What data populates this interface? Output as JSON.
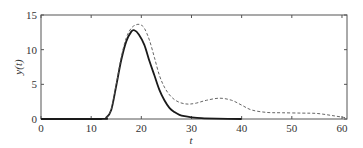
{
  "chart_data": {
    "type": "line",
    "title": "",
    "xlabel": "t",
    "ylabel": "y(t)",
    "xlim": [
      0,
      61
    ],
    "ylim": [
      0,
      15
    ],
    "xticks": [
      0,
      10,
      20,
      30,
      40,
      50,
      60
    ],
    "yticks": [
      0,
      5,
      10,
      15
    ],
    "grid": false,
    "legend": null,
    "series": [
      {
        "name": "solid",
        "style": "solid",
        "color": "#1a1a1a",
        "x": [
          0,
          12,
          13,
          14,
          15,
          16,
          17,
          18,
          18.6,
          19.5,
          20.6,
          21.6,
          22.6,
          23.6,
          24.6,
          25.6,
          26.6,
          27.6,
          28.6,
          30,
          32,
          35,
          40
        ],
        "y": [
          0,
          0,
          0.2,
          1.3,
          4.8,
          8.5,
          11.2,
          12.6,
          12.8,
          12.2,
          10.7,
          8.4,
          6.3,
          4.2,
          2.7,
          1.6,
          1.0,
          0.6,
          0.4,
          0.25,
          0.12,
          0.05,
          0
        ]
      },
      {
        "name": "dashed",
        "style": "dashed",
        "color": "#555555",
        "x": [
          13,
          14,
          15,
          16,
          17,
          18,
          19,
          19.8,
          20.6,
          21.6,
          22.6,
          23.6,
          24.6,
          25.6,
          26.6,
          27.6,
          28.6,
          29.6,
          31,
          33,
          35.6,
          38,
          40,
          42,
          45,
          48,
          52,
          55,
          58,
          61
        ],
        "y": [
          0.2,
          1.4,
          5.0,
          8.9,
          11.7,
          13.1,
          13.6,
          13.6,
          13.1,
          11.4,
          8.9,
          6.3,
          4.6,
          3.5,
          2.8,
          2.4,
          2.2,
          2.15,
          2.3,
          2.7,
          3.0,
          2.7,
          2.0,
          1.3,
          0.95,
          0.9,
          0.85,
          0.8,
          0.5,
          0.15
        ]
      }
    ]
  }
}
